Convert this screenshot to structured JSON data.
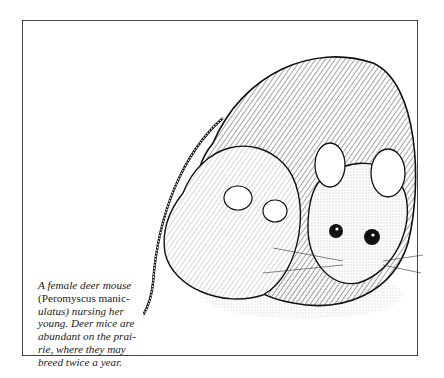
{
  "figure": {
    "illustration_alt": "Pen-and-ink drawing of a female deer mouse curled around, nursing her young",
    "caption": {
      "part1": "A female deer mouse (",
      "scientific_name": "Peromyscus manic- ulatus",
      "part2": ") nursing her young. Deer mice are abundant on the prairie, where they may breed twice a year."
    },
    "caption_lines": [
      "A female deer mouse",
      "(Peromyscus manic-",
      "ulatus) nursing her",
      "young. Deer mice are",
      "abundant on the prai-",
      "rie, where they may",
      "breed twice a year."
    ]
  }
}
